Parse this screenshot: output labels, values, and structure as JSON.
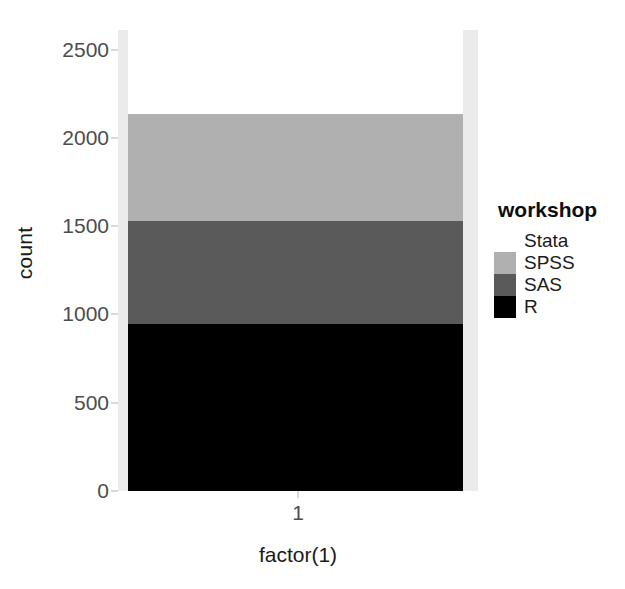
{
  "chart_data": {
    "type": "bar",
    "title": "",
    "subtitle": "",
    "xlabel": "factor(1)",
    "ylabel": "count",
    "categories": [
      "1"
    ],
    "stacked": true,
    "xtick_labels": [
      "1"
    ],
    "ytick_labels": [
      "0",
      "500",
      "1000",
      "1500",
      "2000",
      "2500"
    ],
    "ytick_values": [
      0,
      500,
      1000,
      1500,
      2000,
      2500
    ],
    "ylim": [
      0,
      2611
    ],
    "grid": false,
    "legend": {
      "title": "workshop",
      "position": "right",
      "entries": [
        {
          "label": "Stata",
          "color": "#ffffff"
        },
        {
          "label": "SPSS",
          "color": "#b0b0b0"
        },
        {
          "label": "SAS",
          "color": "#5a5a5a"
        },
        {
          "label": "R",
          "color": "#000000"
        }
      ]
    },
    "series": [
      {
        "name": "R",
        "values": [
          948
        ],
        "color": "#000000",
        "cumulative_top": 948
      },
      {
        "name": "SAS",
        "values": [
          580
        ],
        "color": "#5a5a5a",
        "cumulative_top": 1528
      },
      {
        "name": "SPSS",
        "values": [
          605
        ],
        "color": "#b0b0b0",
        "cumulative_top": 2133
      },
      {
        "name": "Stata",
        "values": [
          478
        ],
        "color": "#ffffff",
        "cumulative_top": 2611
      }
    ],
    "panel_background": "#ebebeb",
    "axis_text_color": "#4d4d4d",
    "title_text_color": "#1a1a1a"
  }
}
